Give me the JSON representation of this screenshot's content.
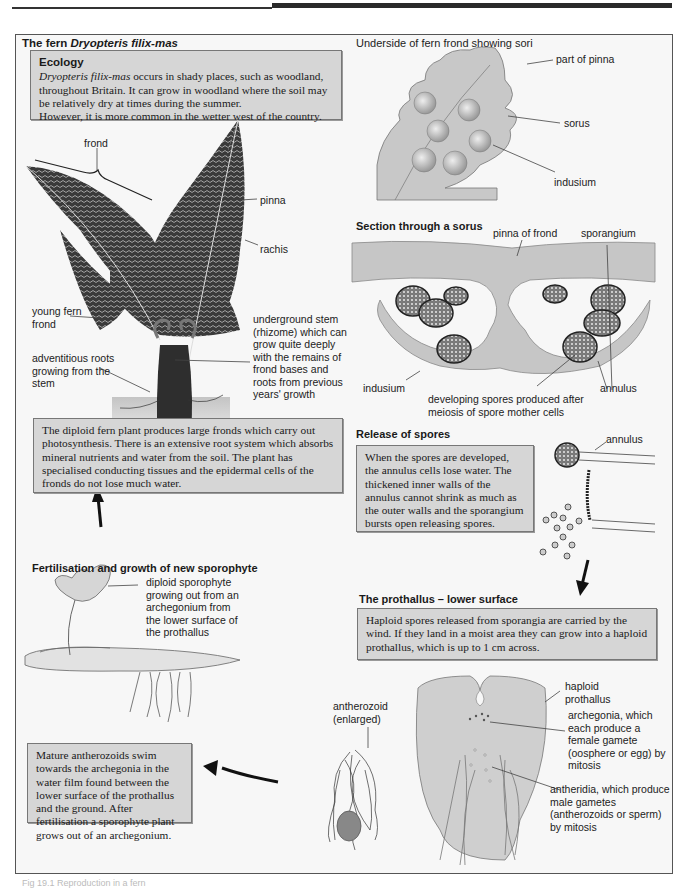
{
  "header": {
    "rule": "top-rule"
  },
  "left": {
    "title_prefix": "The fern ",
    "title_species": "Dryopteris filix-mas",
    "ecology": {
      "heading": "Ecology",
      "species": "Dryopteris filix-mas",
      "text": " occurs in shady places, such as woodland, throughout Britain. It can grow in woodland where the soil may be relatively dry at times during the summer.",
      "text2": "However, it is more common in the wetter west of the country."
    },
    "fern_labels": {
      "frond": "frond",
      "pinna": "pinna",
      "rachis": "rachis",
      "young_frond": "young fern frond",
      "roots": "adventitious roots growing from the stem",
      "rhizome": "underground stem (rhizome) which can grow quite deeply with the remains of frond bases and roots from previous years' growth"
    },
    "diploid_box": "The diploid fern plant produces large fronds which carry out photosynthesis. There is an extensive root system which absorbs mineral nutrients and water from the soil. The plant has specialised conducting tissues and the epidermal cells of the fronds do not lose much water.",
    "fertilisation": {
      "title": "Fertilisation and growth of new sporophyte",
      "label": "diploid sporophyte growing out from an archegonium from the lower surface of the prothallus"
    },
    "antherozoid_box": "Mature antherozoids swim towards the archegonia in the water film found between the lower surface of the prothallus and the ground. After fertilisation a sporophyte plant grows out of an archegonium."
  },
  "right": {
    "underside": {
      "title": "Underside of fern frond showing sori",
      "labels": {
        "pinna_part": "part of pinna",
        "sorus": "sorus",
        "indusium": "indusium"
      }
    },
    "section": {
      "title": "Section through a sorus",
      "labels": {
        "pinna_of_frond": "pinna of frond",
        "sporangium": "sporangium",
        "indusium": "indusium",
        "annulus": "annulus",
        "spores": "developing spores produced after meiosis of spore mother cells"
      }
    },
    "release": {
      "title": "Release of spores",
      "box": "When the spores are developed, the annulus cells lose water. The thickened inner walls of the annulus cannot shrink as much as the outer walls and the sporangium bursts open releasing spores.",
      "annulus": "annulus"
    },
    "prothallus": {
      "title": "The prothallus – lower surface",
      "box": "Haploid spores released from sporangia are carried by the wind. If they land in a moist area they can grow into a haploid prothallus, which is up to 1 cm across.",
      "labels": {
        "haploid": "haploid prothallus",
        "archegonia": "archegonia, which each produce a female gamete (oosphere or egg) by mitosis",
        "antheridia": "antheridia, which produce male gametes (antherozoids or sperm) by mitosis",
        "antherozoid": "antherozoid (enlarged)"
      }
    }
  },
  "caption": "Fig 19.1  Reproduction in a fern",
  "colors": {
    "box_fill": "#d6d6d6",
    "frame_fill": "#f7f7f7",
    "plant_fill": "#c9c9c9",
    "dark": "#2a2a2a"
  }
}
